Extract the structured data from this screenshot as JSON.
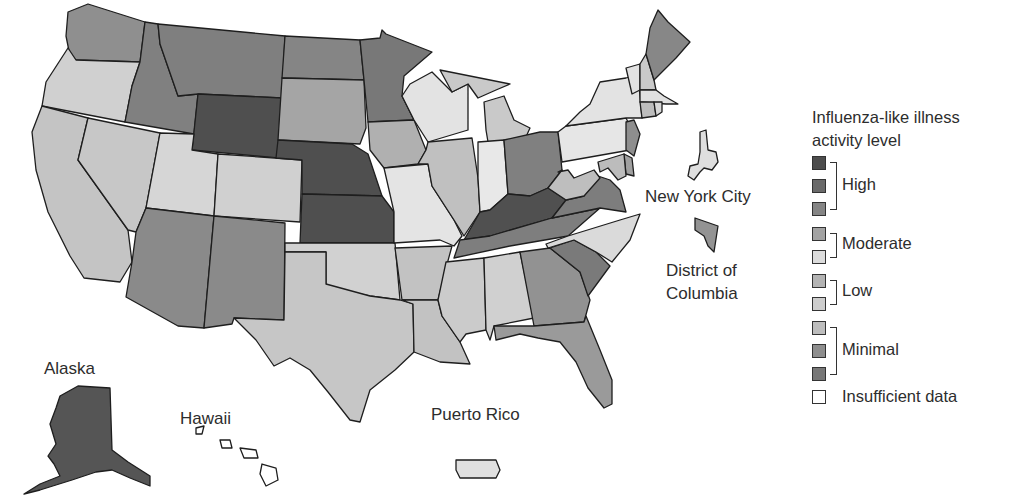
{
  "map": {
    "type": "choropleth",
    "subject": "Influenza-like illness activity level by state",
    "labels": {
      "alaska": "Alaska",
      "hawaii": "Hawaii",
      "puerto_rico": "Puerto Rico",
      "nyc": "New York City",
      "dc_line1": "District of",
      "dc_line2": "Columbia"
    },
    "levels": [
      {
        "level": 10,
        "group": "High",
        "color": "#4d4d4d"
      },
      {
        "level": 9,
        "group": "High",
        "color": "#6a6a6a"
      },
      {
        "level": 8,
        "group": "High",
        "color": "#858585"
      },
      {
        "level": 7,
        "group": "Moderate",
        "color": "#a3a3a3"
      },
      {
        "level": 6,
        "group": "Moderate",
        "color": "#d9d9d9"
      },
      {
        "level": 5,
        "group": "Low",
        "color": "#b3b3b3"
      },
      {
        "level": 4,
        "group": "Low",
        "color": "#c9c9c9"
      },
      {
        "level": 3,
        "group": "Minimal",
        "color": "#bdbdbd"
      },
      {
        "level": 2,
        "group": "Minimal",
        "color": "#8e8e8e"
      },
      {
        "level": 1,
        "group": "Minimal",
        "color": "#777777"
      },
      {
        "level": 0,
        "group": "Insufficient data",
        "color": "#ffffff"
      }
    ],
    "states": {
      "WA": "#8f8f8f",
      "OR": "#d0d0d0",
      "CA": "#c4c4c4",
      "NV": "#c7c7c7",
      "ID": "#808080",
      "MT": "#7f7f7f",
      "WY": "#4f4f4f",
      "UT": "#d6d6d6",
      "CO": "#d0d0d0",
      "AZ": "#8a8a8a",
      "NM": "#8a8a8a",
      "ND": "#858585",
      "SD": "#a5a5a5",
      "NE": "#4f4f4f",
      "KS": "#4f4f4f",
      "OK": "#d1d1d1",
      "TX": "#c6c6c6",
      "MN": "#787878",
      "IA": "#b0b0b0",
      "MO": "#e4e4e4",
      "AR": "#c2c2c2",
      "LA": "#c2c2c2",
      "WI": "#e3e3e3",
      "IL": "#c0c0c0",
      "MI": "#c9c9c9",
      "IN": "#e8e8e8",
      "OH": "#808080",
      "KY": "#505050",
      "TN": "#7e7e7e",
      "MS": "#cbcbcb",
      "AL": "#d0d0d0",
      "GA": "#929292",
      "FL": "#9a9a9a",
      "SC": "#7a7a7a",
      "NC": "#dadada",
      "VA": "#7d7d7d",
      "WV": "#bebebe",
      "PA": "#e6e6e6",
      "NY": "#e3e3e3",
      "VT": "#e2e2e2",
      "NH": "#c9c9c9",
      "ME": "#878787",
      "MA": "#e0e0e0",
      "CT": "#bdbdbd",
      "RI": "#d8d8d8",
      "NJ": "#8e8e8e",
      "DE": "#a0a0a0",
      "MD": "#bcbcbc",
      "AK": "#555555",
      "HI": "#ffffff",
      "PR": "#e0e0e0",
      "NYC": "#dedede",
      "DC": "#939393"
    }
  },
  "legend": {
    "title_line1": "Influenza-like illness",
    "title_line2": "activity level",
    "groups": {
      "high": "High",
      "moderate": "Moderate",
      "low": "Low",
      "minimal": "Minimal",
      "insufficient": "Insufficient data"
    },
    "swatches": [
      "#4d4d4d",
      "#6a6a6a",
      "#858585",
      "#a3a3a3",
      "#dcdcdc",
      "#b3b3b3",
      "#cdcdcd",
      "#bdbdbd",
      "#8e8e8e",
      "#777777",
      "#ffffff"
    ]
  }
}
